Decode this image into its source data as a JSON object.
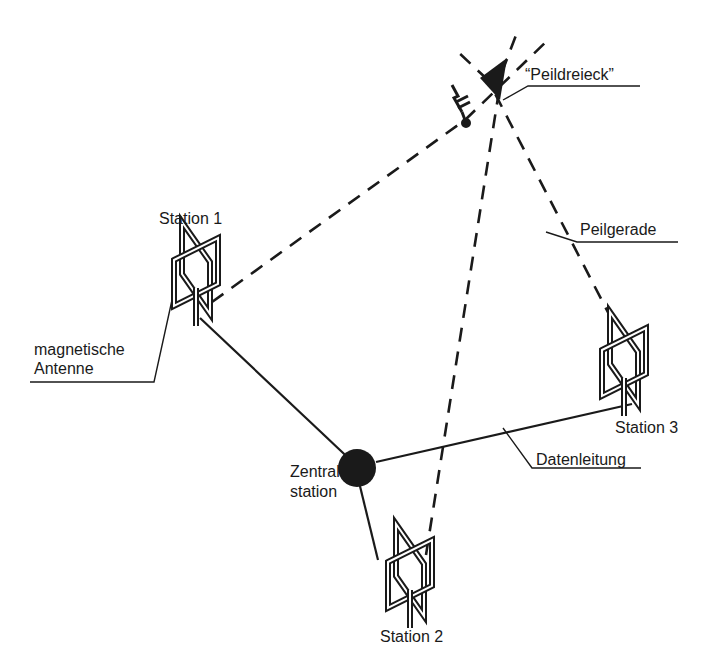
{
  "diagram": {
    "type": "lightning-direction-finding-network",
    "colors": {
      "ink": "#1a1a1a",
      "background": "#ffffff"
    },
    "labels": {
      "triangle": "“Peildreieck”",
      "bearing_line": "Peilgerade",
      "antenna": [
        "magnetische",
        "Antenne"
      ],
      "data_line": "Datenleitung",
      "central": [
        "Zentral-",
        "station"
      ]
    },
    "stations": [
      {
        "id": "station-1",
        "label": "Station 1"
      },
      {
        "id": "station-2",
        "label": "Station 2"
      },
      {
        "id": "station-3",
        "label": "Station 3"
      }
    ],
    "icons": {
      "lightning": "lightning-strike-icon",
      "antenna": "magnetic-loop-antenna-icon",
      "central": "central-station-node-icon"
    }
  }
}
